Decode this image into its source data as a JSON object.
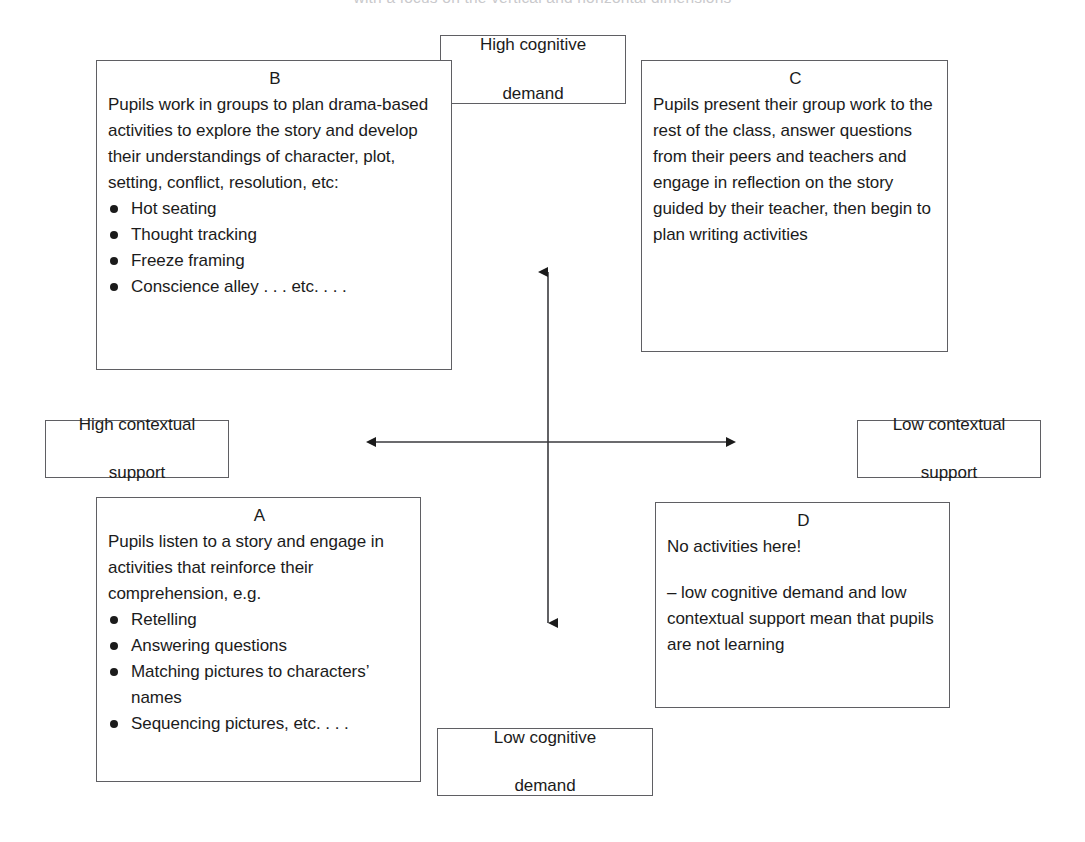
{
  "diagram": {
    "type": "quadrant-matrix",
    "caption_remnant": "with a focus on the vertical and horizontal dimensions",
    "axes": {
      "vertical": {
        "name": "cognitive-demand",
        "top_label": {
          "line1": "High cognitive",
          "line2": "demand"
        },
        "bottom_label": {
          "line1": "Low cognitive",
          "line2": "demand"
        }
      },
      "horizontal": {
        "name": "contextual-support",
        "left_label": {
          "line1": "High contextual",
          "line2": "support"
        },
        "right_label": {
          "line1": "Low contextual",
          "line2": "support"
        }
      }
    },
    "quadrants": [
      {
        "id": "B",
        "position": "top-left",
        "letter": "B",
        "paragraphs": [
          "Pupils work in groups to plan drama-based activities to explore the story and develop their understandings of character, plot, setting, conflict, resolution, etc:"
        ],
        "bullets": [
          "Hot seating",
          "Thought tracking",
          "Freeze framing",
          "Conscience alley . . . etc. . . ."
        ]
      },
      {
        "id": "C",
        "position": "top-right",
        "letter": "C",
        "paragraphs": [
          "Pupils present their group work to the rest of the class, answer questions from their peers and teachers and engage in reflection on the story guided by their teacher, then begin to plan writing activities"
        ],
        "bullets": []
      },
      {
        "id": "A",
        "position": "bottom-left",
        "letter": "A",
        "paragraphs": [
          "Pupils listen to a story and engage in activities that reinforce their comprehension, e.g."
        ],
        "bullets": [
          "Retelling",
          "Answering questions",
          "Matching pictures to characters’ names",
          "Sequencing pictures, etc. . . ."
        ]
      },
      {
        "id": "D",
        "position": "bottom-right",
        "letter": "D",
        "paragraphs": [
          "No activities here!",
          "– low cognitive demand and low contextual support mean that pupils are not learning"
        ],
        "bullets": []
      }
    ],
    "colors": {
      "background": "#ffffff",
      "border": "#5f5f63",
      "text": "#1b1b1b",
      "arrow": "#1b1b1b"
    }
  }
}
